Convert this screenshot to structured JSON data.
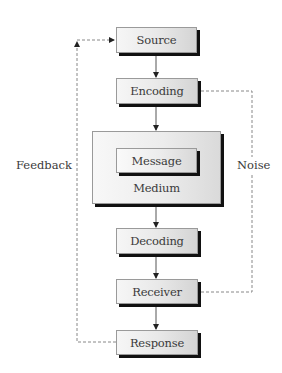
{
  "diagram": {
    "title": "",
    "nodes": [
      {
        "id": "source",
        "label": "Source"
      },
      {
        "id": "encoding",
        "label": "Encoding"
      },
      {
        "id": "medium",
        "label": "Medium",
        "contains": [
          "message"
        ]
      },
      {
        "id": "message",
        "label": "Message"
      },
      {
        "id": "decoding",
        "label": "Decoding"
      },
      {
        "id": "receiver",
        "label": "Receiver"
      },
      {
        "id": "response",
        "label": "Response"
      }
    ],
    "edges": [
      {
        "from": "source",
        "to": "encoding",
        "style": "solid"
      },
      {
        "from": "encoding",
        "to": "medium",
        "style": "solid"
      },
      {
        "from": "medium",
        "to": "decoding",
        "style": "solid"
      },
      {
        "from": "decoding",
        "to": "receiver",
        "style": "solid"
      },
      {
        "from": "receiver",
        "to": "response",
        "style": "solid"
      },
      {
        "from": "response",
        "to": "source",
        "style": "dashed",
        "label": "Feedback"
      },
      {
        "from": "encoding",
        "to": "receiver",
        "style": "dashed",
        "label": "Noise"
      }
    ],
    "labels": {
      "source": "Source",
      "encoding": "Encoding",
      "message": "Message",
      "medium": "Medium",
      "decoding": "Decoding",
      "receiver": "Receiver",
      "response": "Response",
      "feedback": "Feedback",
      "noise": "Noise"
    },
    "colors": {
      "line": "#555555",
      "dashed_line": "#888888",
      "shadow": "#111111",
      "text": "#3a3a3a"
    }
  }
}
